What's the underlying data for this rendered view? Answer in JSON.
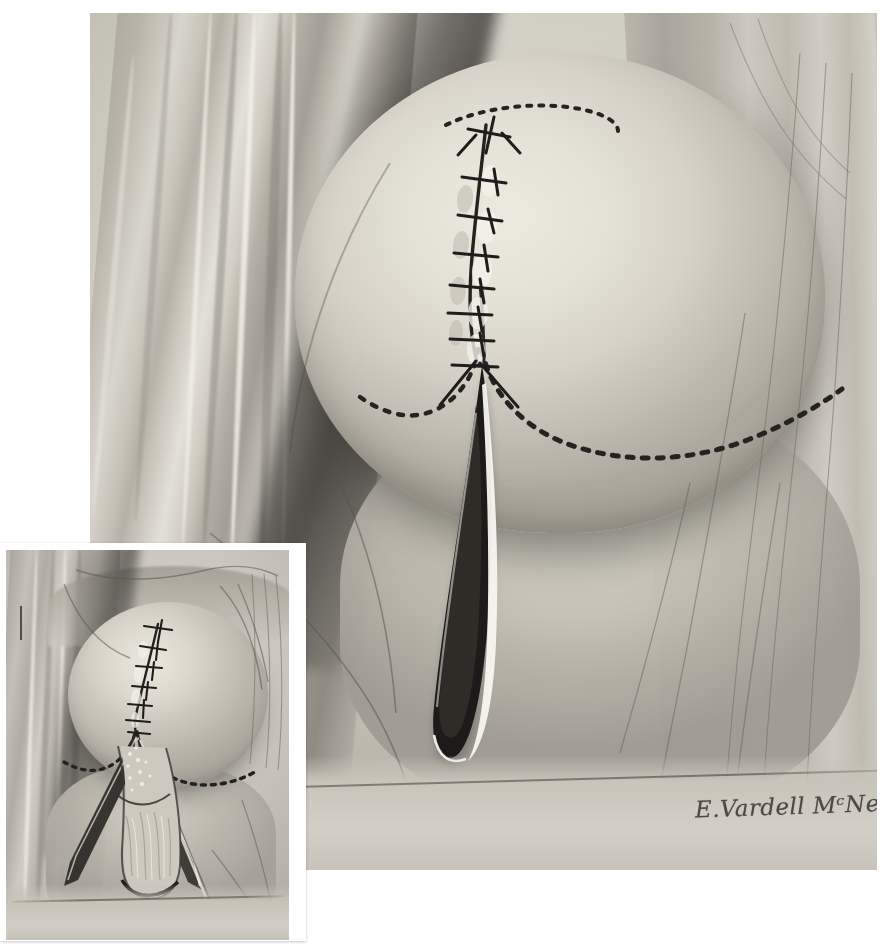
{
  "figure": {
    "kind": "medical-surgical-illustration",
    "medium": "halftone-printed pen-and-wash drawing",
    "panels": 2,
    "background_color": "#ffffff"
  },
  "main_plate": {
    "name": "main-illustration",
    "x": 90,
    "y": 13,
    "width": 787,
    "height": 857,
    "tone_light": "#ecead e",
    "tone_mid": "#c2beb3",
    "tone_dark": "#8e8a81",
    "ink_color": "#2a2825",
    "highlight_color": "#f6f4ec",
    "elements": {
      "dome_label": "everted rounded tissue mass",
      "suture_line_label": "interrupted suture line",
      "suture_count": 9,
      "dashed_arc_top_label": "dashed arc marking at apex",
      "dashed_arc_left_label": "dashed curved marking, left",
      "dashed_arc_right_label": "dashed curved marking, right",
      "incision_label": "open vertical incision with highlighted edge",
      "drape_left_label": "left drape folds",
      "drape_right_label": "right drape folds",
      "sheet_label": "lower drape sheet edge"
    }
  },
  "inset_plate": {
    "name": "inset-illustration",
    "x": 0,
    "y": 543,
    "width": 306,
    "height": 398,
    "frame_color": "#ffffff",
    "elements": {
      "dome_label": "everted rounded tissue mass",
      "suture_line_label": "interrupted suture line",
      "suture_count": 8,
      "dashed_arc_left_label": "dashed curved marking, left",
      "dashed_arc_right_label": "dashed curved marking, right",
      "flap_label": "opened V-shaped flap exposing underlying tissue",
      "retractor_label": "retractor blade",
      "scale_tick_label": "scale tick mark"
    }
  },
  "signature": {
    "text": "E.Vardell MᶜNett",
    "artist": "E. Vardell McNett",
    "color": "#3a3834"
  }
}
